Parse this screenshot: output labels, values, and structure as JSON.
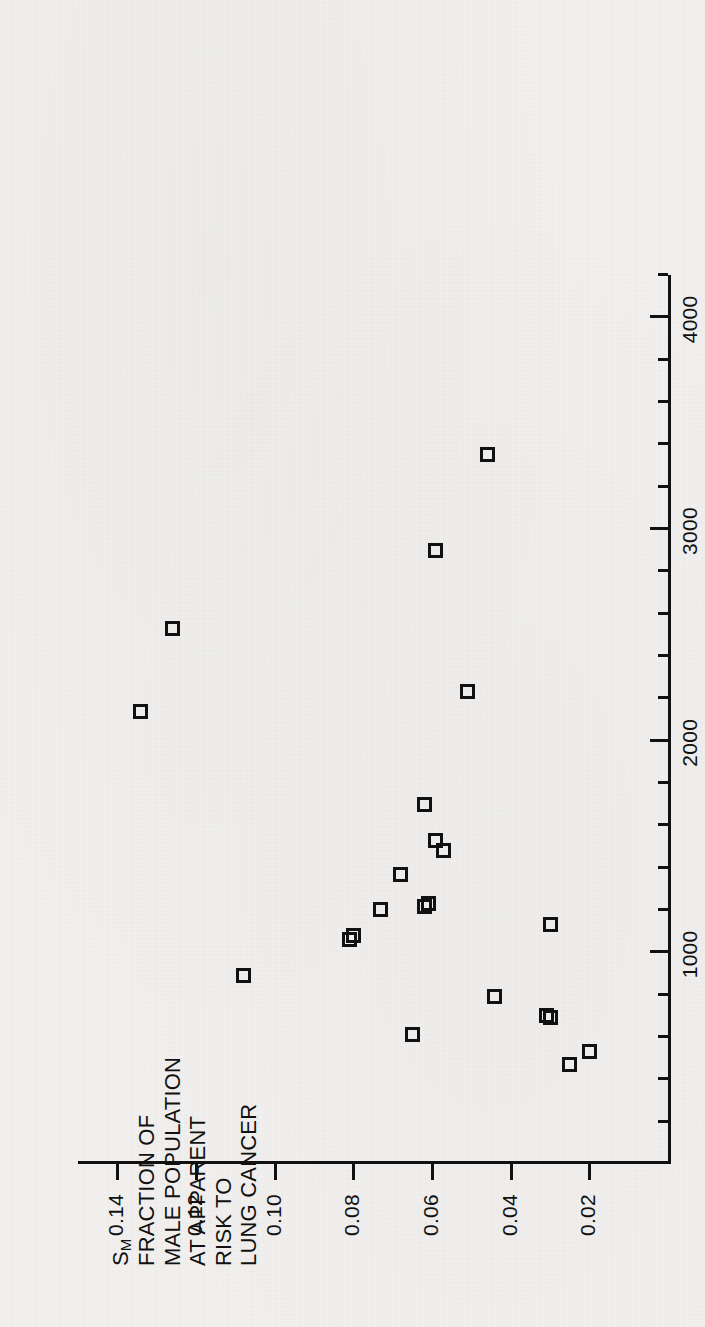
{
  "figure": {
    "x_axis": {
      "title": "CIGARETTE CONSUMPTION, 1950, number per adult",
      "tick_labels": [
        "1000",
        "2000",
        "3000",
        "4000"
      ],
      "major_ticks": [
        1000,
        2000,
        3000,
        4000
      ],
      "minor_tick_step": 200,
      "range": [
        0,
        4200
      ]
    },
    "y_axis": {
      "title_lines": [
        "FRACTION OF",
        "MALE POPULATION",
        "AT APPARENT",
        "RISK TO",
        "LUNG CANCER"
      ],
      "symbol": "S",
      "symbol_subscript": "M",
      "tick_labels": [
        "0.02",
        "0.04",
        "0.06",
        "0.08",
        "0.10",
        "0.12",
        "0.14"
      ],
      "major_ticks": [
        0.02,
        0.04,
        0.06,
        0.08,
        0.1,
        0.12,
        0.14
      ],
      "range": [
        0,
        0.15
      ]
    },
    "colors": {
      "ink": "#111111",
      "paper": "#f2f1ef"
    },
    "marker_shape": "open-square"
  },
  "chart_data": {
    "type": "scatter",
    "title": "",
    "xlabel": "CIGARETTE CONSUMPTION, 1950, number per adult",
    "ylabel": "S_M  FRACTION OF MALE POPULATION AT APPARENT RISK TO LUNG CANCER",
    "xlim": [
      0,
      4200
    ],
    "ylim": [
      0,
      0.15
    ],
    "grid": false,
    "legend": null,
    "x": [
      3350,
      2900,
      2530,
      2140,
      2230,
      1700,
      1530,
      1480,
      1370,
      1230,
      1140,
      1130,
      1210,
      1080,
      1060,
      890,
      790,
      770,
      610,
      530,
      470
    ],
    "y": [
      0.046,
      0.059,
      0.126,
      0.134,
      0.051,
      0.062,
      0.059,
      0.057,
      0.068,
      0.079,
      0.073,
      0.062,
      0.061,
      0.08,
      0.081,
      0.108,
      0.044,
      0.031,
      0.03,
      0.065,
      0.025
    ],
    "points": [
      {
        "x": 3350,
        "y": 0.046
      },
      {
        "x": 2900,
        "y": 0.059
      },
      {
        "x": 2530,
        "y": 0.126
      },
      {
        "x": 2230,
        "y": 0.051
      },
      {
        "x": 2140,
        "y": 0.134
      },
      {
        "x": 1700,
        "y": 0.062
      },
      {
        "x": 1530,
        "y": 0.059
      },
      {
        "x": 1480,
        "y": 0.057
      },
      {
        "x": 1370,
        "y": 0.068
      },
      {
        "x": 1230,
        "y": 0.061
      },
      {
        "x": 1215,
        "y": 0.062
      },
      {
        "x": 1200,
        "y": 0.073
      },
      {
        "x": 1130,
        "y": 0.03
      },
      {
        "x": 1080,
        "y": 0.08
      },
      {
        "x": 1060,
        "y": 0.081
      },
      {
        "x": 890,
        "y": 0.108
      },
      {
        "x": 790,
        "y": 0.044
      },
      {
        "x": 700,
        "y": 0.031
      },
      {
        "x": 690,
        "y": 0.03
      },
      {
        "x": 610,
        "y": 0.065
      },
      {
        "x": 530,
        "y": 0.02
      },
      {
        "x": 470,
        "y": 0.025
      }
    ]
  }
}
